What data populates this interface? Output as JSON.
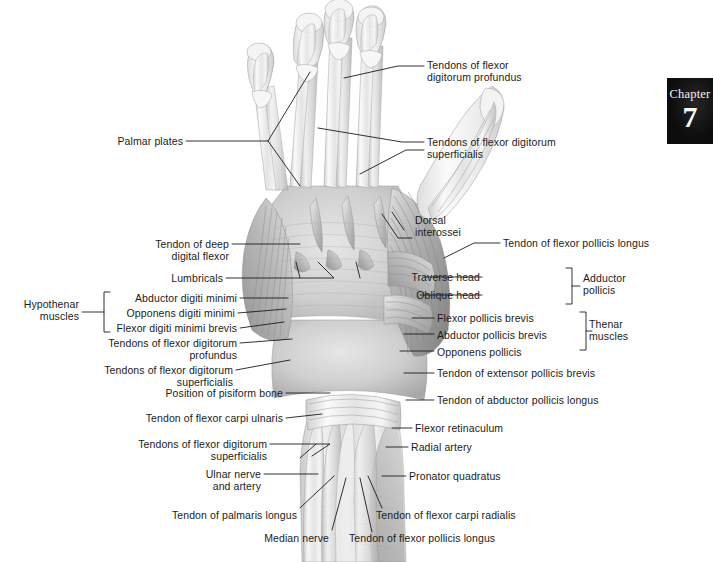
{
  "figure": {
    "view": "anterior (palmar) deep dissection of right hand and wrist",
    "style": "grayscale pencil/airbrush anatomical illustration",
    "background_color": "#ffffff",
    "line_color": "#1b1b1b"
  },
  "chapter_badge": {
    "word": "Chapter",
    "number": "7",
    "background_color": "#0d0d0d",
    "text_color": "#f7f7f7"
  },
  "labels": [
    {
      "id": "tendons-fdp-top",
      "text": "Tendons of flexor\ndigitorum profundus"
    },
    {
      "id": "palmar-plates",
      "text": "Palmar plates"
    },
    {
      "id": "tendons-fds-top",
      "text": "Tendons of flexor digitorum\nsuperficialis"
    },
    {
      "id": "dorsal-interossei",
      "text": "Dorsal\ninterossei"
    },
    {
      "id": "tendon-deep-digital",
      "text": "Tendon of deep\ndigital flexor"
    },
    {
      "id": "tendon-fpl-upper",
      "text": "Tendon of flexor pollicis longus"
    },
    {
      "id": "lumbricals",
      "text": "Lumbricals"
    },
    {
      "id": "traverse-head",
      "text": "Traverse head"
    },
    {
      "id": "oblique-head",
      "text": "Oblique head"
    },
    {
      "id": "adductor-pollicis",
      "text": "Adductor\npollicis"
    },
    {
      "id": "hypothenar-muscles",
      "text": "Hypothenar\nmuscles"
    },
    {
      "id": "abductor-digiti-minimi",
      "text": "Abductor digiti minimi"
    },
    {
      "id": "opponens-digiti-minimi",
      "text": "Opponens digiti minimi"
    },
    {
      "id": "fdmb",
      "text": "Flexor digiti minimi brevis"
    },
    {
      "id": "flexor-pollicis-brevis",
      "text": "Flexor pollicis brevis"
    },
    {
      "id": "abductor-pollicis-brevis",
      "text": "Abductor pollicis brevis"
    },
    {
      "id": "opponens-pollicis",
      "text": "Opponens pollicis"
    },
    {
      "id": "thenar-muscles",
      "text": "Thenar\nmuscles"
    },
    {
      "id": "tendons-fdp-left",
      "text": "Tendons of flexor digitorum\nprofundus"
    },
    {
      "id": "tendons-fds-left",
      "text": "Tendons of flexor digitorum\nsuperficialis"
    },
    {
      "id": "tendon-epb",
      "text": "Tendon of extensor pollicis brevis"
    },
    {
      "id": "tendon-apl",
      "text": "Tendon of abductor pollicis longus"
    },
    {
      "id": "pisiform",
      "text": "Position of pisiform bone"
    },
    {
      "id": "tendon-fcu",
      "text": "Tendon of flexor carpi ulnaris"
    },
    {
      "id": "flexor-retinaculum",
      "text": "Flexor retinaculum"
    },
    {
      "id": "tendons-fds-wrist",
      "text": "Tendons of flexor digitorum\nsuperficialis"
    },
    {
      "id": "radial-artery",
      "text": "Radial artery"
    },
    {
      "id": "ulnar-nerve-artery",
      "text": "Ulnar nerve\nand artery"
    },
    {
      "id": "pronator-quadratus",
      "text": "Pronator quadratus"
    },
    {
      "id": "tendon-palmaris-longus",
      "text": "Tendon of palmaris longus"
    },
    {
      "id": "tendon-fcr",
      "text": "Tendon of flexor carpi radialis"
    },
    {
      "id": "median-nerve",
      "text": "Median nerve"
    },
    {
      "id": "tendon-fpl-bottom",
      "text": "Tendon of flexor pollicis longus"
    }
  ]
}
